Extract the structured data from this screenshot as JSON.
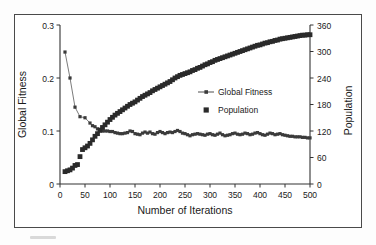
{
  "chart_data": {
    "type": "line",
    "title": "",
    "xlabel": "Number of Iterations",
    "ylabel": "Global Fitness",
    "y2label": "Population",
    "xlim": [
      0,
      500
    ],
    "ylim": [
      0,
      0.3
    ],
    "y2lim": [
      0,
      360
    ],
    "xticks": [
      0,
      50,
      100,
      150,
      200,
      250,
      300,
      350,
      400,
      450,
      500
    ],
    "xtick_labels": [
      "0",
      "50",
      "100",
      "150",
      "200",
      "250",
      "300",
      "350",
      "400",
      "450",
      "500"
    ],
    "yticks": [
      0,
      0.1,
      0.2,
      0.3
    ],
    "ytick_labels": [
      "0",
      "0.1",
      "0.2",
      "0.3"
    ],
    "y2ticks": [
      0,
      60,
      120,
      180,
      240,
      300,
      360
    ],
    "y2tick_labels": [
      "0",
      "60",
      "120",
      "180",
      "240",
      "300",
      "360"
    ],
    "grid": false,
    "legend_position": "center-right",
    "series": [
      {
        "name": "Global Fitness",
        "axis": "left",
        "marker": "small-square",
        "line": true,
        "color": "#3b3b3b",
        "x": [
          10,
          20,
          30,
          40,
          50,
          60,
          65,
          70,
          75,
          80,
          85,
          90,
          95,
          100,
          105,
          110,
          115,
          120,
          125,
          130,
          135,
          140,
          145,
          150,
          155,
          160,
          165,
          170,
          175,
          180,
          185,
          190,
          195,
          200,
          205,
          210,
          215,
          220,
          225,
          230,
          235,
          240,
          245,
          250,
          255,
          260,
          265,
          270,
          275,
          280,
          285,
          290,
          295,
          300,
          305,
          310,
          315,
          320,
          325,
          330,
          335,
          340,
          345,
          350,
          355,
          360,
          365,
          370,
          375,
          380,
          385,
          390,
          395,
          400,
          405,
          410,
          415,
          420,
          425,
          430,
          435,
          440,
          445,
          450,
          455,
          460,
          465,
          470,
          475,
          480,
          485,
          490,
          495,
          500
        ],
        "y": [
          0.249,
          0.2,
          0.145,
          0.127,
          0.125,
          0.115,
          0.11,
          0.108,
          0.104,
          0.1,
          0.1,
          0.1,
          0.1,
          0.099,
          0.099,
          0.097,
          0.096,
          0.095,
          0.095,
          0.096,
          0.097,
          0.1,
          0.099,
          0.095,
          0.094,
          0.093,
          0.096,
          0.098,
          0.096,
          0.098,
          0.095,
          0.094,
          0.097,
          0.099,
          0.097,
          0.095,
          0.097,
          0.098,
          0.097,
          0.099,
          0.101,
          0.099,
          0.096,
          0.095,
          0.093,
          0.091,
          0.093,
          0.094,
          0.095,
          0.094,
          0.093,
          0.092,
          0.094,
          0.095,
          0.093,
          0.092,
          0.094,
          0.096,
          0.093,
          0.091,
          0.092,
          0.093,
          0.095,
          0.096,
          0.094,
          0.093,
          0.094,
          0.096,
          0.095,
          0.093,
          0.094,
          0.096,
          0.097,
          0.095,
          0.093,
          0.092,
          0.094,
          0.096,
          0.095,
          0.093,
          0.094,
          0.095,
          0.093,
          0.092,
          0.091,
          0.09,
          0.09,
          0.089,
          0.089,
          0.089,
          0.088,
          0.088,
          0.087,
          0.087
        ]
      },
      {
        "name": "Population",
        "axis": "right",
        "marker": "large-square",
        "line": false,
        "color": "#2a2a2a",
        "x": [
          10,
          15,
          20,
          25,
          30,
          35,
          40,
          45,
          50,
          55,
          60,
          65,
          70,
          75,
          80,
          85,
          90,
          95,
          100,
          105,
          110,
          115,
          120,
          125,
          130,
          135,
          140,
          145,
          150,
          155,
          160,
          165,
          170,
          175,
          180,
          185,
          190,
          195,
          200,
          205,
          210,
          215,
          220,
          225,
          230,
          235,
          240,
          245,
          250,
          255,
          260,
          265,
          270,
          275,
          280,
          285,
          290,
          295,
          300,
          305,
          310,
          315,
          320,
          325,
          330,
          335,
          340,
          345,
          350,
          355,
          360,
          365,
          370,
          375,
          380,
          385,
          390,
          395,
          400,
          405,
          410,
          415,
          420,
          425,
          430,
          435,
          440,
          445,
          450,
          455,
          460,
          465,
          470,
          475,
          480,
          485,
          490,
          495,
          500
        ],
        "y": [
          28,
          30,
          32,
          36,
          42,
          44,
          62,
          78,
          82,
          86,
          92,
          100,
          108,
          114,
          122,
          128,
          134,
          140,
          146,
          151,
          156,
          160,
          164,
          168,
          172,
          176,
          180,
          183,
          186,
          190,
          194,
          198,
          201,
          204,
          207,
          211,
          214,
          217,
          220,
          223,
          226,
          229,
          232,
          236,
          240,
          243,
          246,
          248,
          250,
          252,
          254,
          257,
          259,
          262,
          264,
          267,
          270,
          272,
          275,
          277,
          280,
          282,
          284,
          286,
          288,
          290,
          292,
          294,
          296,
          298,
          300,
          302,
          304,
          306,
          308,
          310,
          312,
          314,
          315,
          317,
          319,
          320,
          322,
          323,
          325,
          326,
          328,
          329,
          330,
          331,
          332,
          333,
          334,
          335,
          336,
          337,
          337,
          338,
          338
        ]
      }
    ],
    "legend": [
      {
        "label": "Global Fitness",
        "marker": "small-square-with-line"
      },
      {
        "label": "Population",
        "marker": "large-square"
      }
    ]
  }
}
